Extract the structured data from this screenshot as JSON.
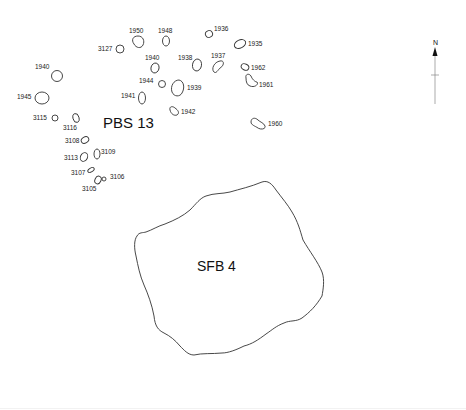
{
  "structures": {
    "pbs": {
      "label": "PBS 13"
    },
    "sfb": {
      "label": "SFB 4"
    }
  },
  "postholes": [
    {
      "id": "3127",
      "label": "3127"
    },
    {
      "id": "1950",
      "label": "1950"
    },
    {
      "id": "1948",
      "label": "1948"
    },
    {
      "id": "1936",
      "label": "1936"
    },
    {
      "id": "1935",
      "label": "1935"
    },
    {
      "id": "1940a",
      "label": "1940"
    },
    {
      "id": "1938",
      "label": "1938"
    },
    {
      "id": "1937",
      "label": "1937"
    },
    {
      "id": "1962",
      "label": "1962"
    },
    {
      "id": "1940b",
      "label": "1940"
    },
    {
      "id": "1944",
      "label": "1944"
    },
    {
      "id": "1939",
      "label": "1939"
    },
    {
      "id": "1961",
      "label": "1961"
    },
    {
      "id": "1945",
      "label": "1945"
    },
    {
      "id": "1941",
      "label": "1941"
    },
    {
      "id": "1942",
      "label": "1942"
    },
    {
      "id": "1960",
      "label": "1960"
    },
    {
      "id": "3115",
      "label": "3115"
    },
    {
      "id": "3116",
      "label": "3116"
    },
    {
      "id": "3108",
      "label": "3108"
    },
    {
      "id": "3113",
      "label": "3113"
    },
    {
      "id": "3109",
      "label": "3109"
    },
    {
      "id": "3107",
      "label": "3107"
    },
    {
      "id": "3106",
      "label": "3106"
    },
    {
      "id": "3105",
      "label": "3105"
    }
  ],
  "north_arrow": {
    "label": "N",
    "icon": "north-arrow-icon"
  }
}
